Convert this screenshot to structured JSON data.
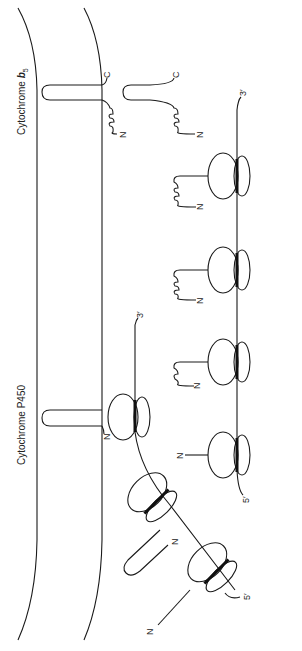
{
  "labels": {
    "cytochrome_b5": "Cytochrome",
    "cytochrome_b5_italic": "b",
    "cytochrome_b5_sub": "5",
    "cytochrome_p450": "Cytochrome  P450",
    "n_terminus": "N",
    "c_terminus": "C",
    "three_prime": "3′",
    "five_prime": "5′"
  },
  "structures": {
    "membrane": "ER membrane (two curved lines)",
    "free_polysome": "Free polysome with 4 ribosomes on mRNA, nascent helical chains labeled N",
    "bound_ribosomes": "Membrane-bound ribosomes synthesizing cytochrome P450, N-terminal anchor inserted into membrane",
    "b5_proteins": "Two cytochrome b5 molecules anchored via C-terminal hairpin"
  },
  "colors": {
    "line": "#1a1a1a",
    "background": "#ffffff"
  }
}
